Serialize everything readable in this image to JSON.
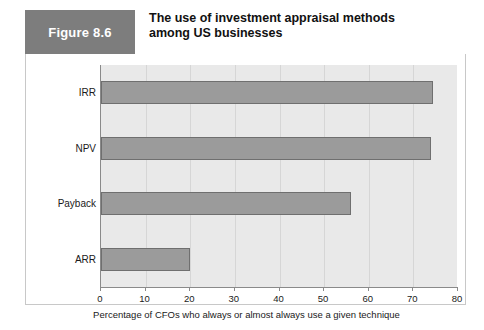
{
  "figure": {
    "badge_label": "Figure 8.6",
    "title": "The use of investment appraisal methods among US businesses",
    "badge_color": "#7d7d7d",
    "card_border_color": "#c8c8c8"
  },
  "chart_data": {
    "type": "bar",
    "orientation": "horizontal",
    "title": "The use of investment appraisal methods among US businesses",
    "categories": [
      "IRR",
      "NPV",
      "Payback",
      "ARR"
    ],
    "values": [
      74.5,
      74,
      56,
      20
    ],
    "series": [
      {
        "name": "Percentage of CFOs",
        "values": [
          74.5,
          74,
          56,
          20
        ]
      }
    ],
    "xlabel": "Percentage of CFOs who always or almost always use a given technique",
    "ylabel": "",
    "xlim": [
      0,
      80
    ],
    "xticks": [
      0,
      10,
      20,
      30,
      40,
      50,
      60,
      70,
      80
    ],
    "xtick_labels": [
      "0",
      "10",
      "20",
      "30",
      "40",
      "50",
      "60",
      "70",
      "80"
    ],
    "grid": "vertical",
    "legend": "none",
    "bar_color": "#9b9b9b",
    "bar_edge_color": "#6f6f6f",
    "plot_background": "#e9e9e9",
    "axis_color": "#8a8a8a"
  }
}
